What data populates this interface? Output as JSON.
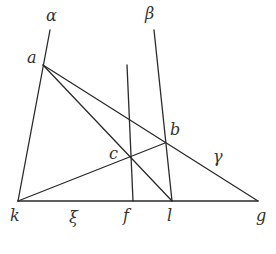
{
  "diagram": {
    "type": "geometric-construction",
    "lines": [
      {
        "name": "alpha",
        "label": "α",
        "from": [
          50,
          30
        ],
        "to": [
          18,
          201
        ]
      },
      {
        "name": "beta",
        "label": "β",
        "from": [
          154,
          30
        ],
        "to": [
          172,
          201
        ]
      },
      {
        "name": "f-vertical",
        "from": [
          127,
          65
        ],
        "to": [
          133,
          201
        ]
      },
      {
        "name": "kg-baseline",
        "label": "ξ",
        "from": [
          18,
          201
        ],
        "to": [
          258,
          201
        ]
      },
      {
        "name": "ag-gamma",
        "label": "γ",
        "from": [
          43,
          65
        ],
        "to": [
          258,
          201
        ]
      },
      {
        "name": "al",
        "from": [
          43,
          65
        ],
        "to": [
          172,
          201
        ]
      },
      {
        "name": "kb",
        "from": [
          18,
          201
        ],
        "to": [
          165,
          143
        ]
      }
    ],
    "points": {
      "a": "a",
      "b": "b",
      "c": "c",
      "k": "k",
      "f": "f",
      "l": "l",
      "g": "g"
    },
    "line_labels": {
      "alpha": "α",
      "beta": "β",
      "gamma": "γ",
      "xi": "ξ"
    }
  }
}
